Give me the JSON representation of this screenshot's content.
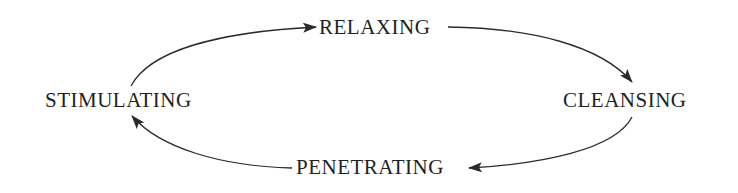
{
  "diagram": {
    "type": "cycle",
    "direction": "clockwise",
    "nodes": [
      {
        "id": "relaxing",
        "label": "RELAXING",
        "position": "top"
      },
      {
        "id": "cleansing",
        "label": "CLEANSING",
        "position": "right"
      },
      {
        "id": "penetrating",
        "label": "PENETRATING",
        "position": "bottom"
      },
      {
        "id": "stimulating",
        "label": "STIMULATING",
        "position": "left"
      }
    ],
    "edges": [
      {
        "from": "stimulating",
        "to": "relaxing"
      },
      {
        "from": "relaxing",
        "to": "cleansing"
      },
      {
        "from": "cleansing",
        "to": "penetrating"
      },
      {
        "from": "penetrating",
        "to": "stimulating"
      }
    ],
    "colors": {
      "text": "#1f1f24",
      "arrow": "#2a2a30",
      "background": "#ffffff"
    }
  }
}
